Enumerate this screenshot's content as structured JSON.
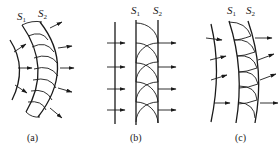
{
  "figure": {
    "panels": [
      {
        "id": "a",
        "caption": "(a)",
        "surface1": "S",
        "surface1_sub": "1",
        "surface2": "S",
        "surface2_sub": "2",
        "type": "spherical wavefront"
      },
      {
        "id": "b",
        "caption": "(b)",
        "surface1": "S",
        "surface1_sub": "1",
        "surface2": "S",
        "surface2_sub": "2",
        "type": "plane wavefront"
      },
      {
        "id": "c",
        "caption": "(c)",
        "surface1": "S",
        "surface1_sub": "1",
        "surface2": "S",
        "surface2_sub": "2",
        "type": "curved wavefront"
      }
    ],
    "colors": {
      "ink": "#1a1a1a",
      "background": "#ffffff"
    }
  }
}
